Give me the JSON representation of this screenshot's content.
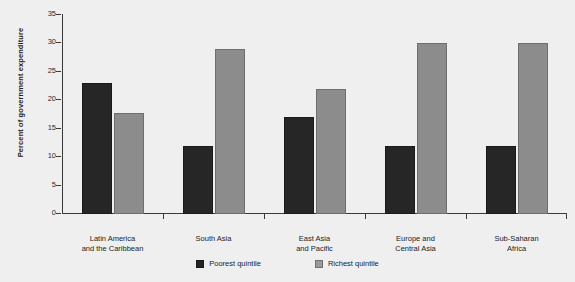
{
  "chart_data": {
    "type": "bar",
    "title": "",
    "subtitle": "",
    "xlabel": "",
    "ylabel": "Percent of government expenditure",
    "ylim": [
      0,
      35
    ],
    "yticks": [
      0,
      5,
      10,
      15,
      20,
      25,
      30,
      35
    ],
    "grid": false,
    "legend_position": "bottom",
    "categories": [
      "Latin America\nand the Caribbean",
      "South Asia",
      "East Asia\nand Pacific",
      "Europe and\nCentral Asia",
      "Sub-Saharan\nAfrica"
    ],
    "category_lines": [
      [
        "Latin America",
        "and the Caribbean"
      ],
      [
        "South Asia",
        ""
      ],
      [
        "East Asia",
        "and Pacific"
      ],
      [
        "Europe and",
        "Central Asia"
      ],
      [
        "Sub-Saharan",
        "Africa"
      ]
    ],
    "series": [
      {
        "name": "Poorest quintile",
        "color": "#262626",
        "values": [
          23,
          12,
          17,
          12,
          12
        ]
      },
      {
        "name": "Richest quintile",
        "color": "#8c8c8c",
        "values": [
          17.8,
          29,
          22,
          30,
          30.1
        ]
      }
    ]
  },
  "axis": {
    "y_title": "Percent of government expenditure",
    "y_tick_labels": [
      "0",
      "5",
      "10",
      "15",
      "20",
      "25",
      "30",
      "35"
    ]
  },
  "legend": {
    "items": [
      {
        "label": "Poorest quintile",
        "swatch": "poorest"
      },
      {
        "label": "Richest quintile",
        "swatch": "richest"
      }
    ]
  },
  "colors": {
    "background": "#efefef",
    "poorest": "#262626",
    "richest": "#8c8c8c",
    "axis": "#3a3a3a",
    "text": "#1c1c1c"
  }
}
